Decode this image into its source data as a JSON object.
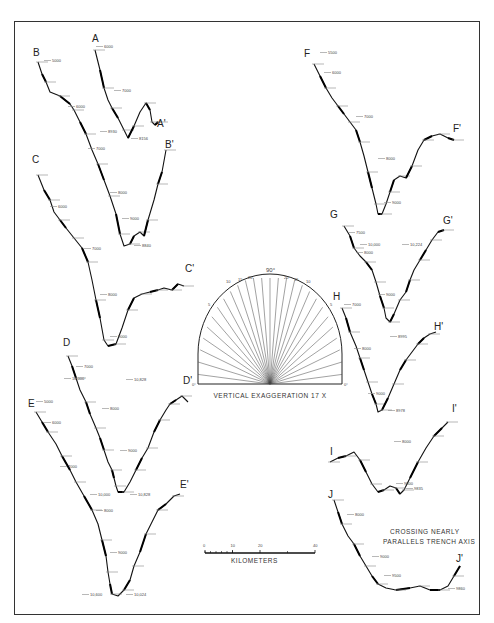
{
  "figure": {
    "frame": {
      "x": 14,
      "y": 21,
      "w": 466,
      "h": 594
    }
  },
  "profiles": [
    {
      "id": "A",
      "start_label": "A",
      "end_label": "A'",
      "start_pos": [
        92,
        42
      ],
      "end_pos": [
        157,
        127
      ],
      "points": [
        [
          95,
          50
        ],
        [
          100,
          70
        ],
        [
          104,
          88
        ],
        [
          108,
          100
        ],
        [
          112,
          108
        ],
        [
          118,
          118
        ],
        [
          124,
          130
        ],
        [
          128,
          138
        ],
        [
          134,
          126
        ],
        [
          140,
          112
        ],
        [
          146,
          103
        ],
        [
          150,
          110
        ],
        [
          152,
          122
        ],
        [
          155,
          125
        ],
        [
          158,
          122
        ]
      ],
      "depth_labels": [
        {
          "text": "6000",
          "x": 104,
          "y": 48
        },
        {
          "text": "7000",
          "x": 122,
          "y": 92
        },
        {
          "text": "8930",
          "x": 108,
          "y": 133
        },
        {
          "text": "8156",
          "x": 139,
          "y": 140
        }
      ]
    },
    {
      "id": "B",
      "start_label": "B",
      "end_label": "B'",
      "start_pos": [
        33,
        56
      ],
      "end_pos": [
        165,
        148
      ],
      "points": [
        [
          38,
          62
        ],
        [
          42,
          74
        ],
        [
          46,
          82
        ],
        [
          50,
          92
        ],
        [
          60,
          96
        ],
        [
          70,
          104
        ],
        [
          74,
          110
        ],
        [
          80,
          122
        ],
        [
          86,
          134
        ],
        [
          92,
          150
        ],
        [
          98,
          164
        ],
        [
          104,
          180
        ],
        [
          110,
          196
        ],
        [
          116,
          214
        ],
        [
          120,
          234
        ],
        [
          124,
          246
        ],
        [
          130,
          244
        ],
        [
          134,
          236
        ],
        [
          140,
          232
        ],
        [
          144,
          236
        ],
        [
          148,
          220
        ],
        [
          154,
          200
        ],
        [
          158,
          184
        ],
        [
          162,
          172
        ],
        [
          166,
          150
        ]
      ],
      "depth_labels": [
        {
          "text": "5000",
          "x": 52,
          "y": 62
        },
        {
          "text": "6000",
          "x": 76,
          "y": 108
        },
        {
          "text": "7000",
          "x": 96,
          "y": 150
        },
        {
          "text": "8000",
          "x": 118,
          "y": 194
        },
        {
          "text": "9000",
          "x": 130,
          "y": 220
        },
        {
          "text": "8840",
          "x": 142,
          "y": 247
        }
      ]
    },
    {
      "id": "C",
      "start_label": "C",
      "end_label": "C'",
      "start_pos": [
        32,
        163
      ],
      "end_pos": [
        185,
        272
      ],
      "points": [
        [
          38,
          175
        ],
        [
          44,
          190
        ],
        [
          50,
          200
        ],
        [
          54,
          212
        ],
        [
          60,
          220
        ],
        [
          66,
          228
        ],
        [
          74,
          238
        ],
        [
          82,
          248
        ],
        [
          88,
          262
        ],
        [
          92,
          280
        ],
        [
          96,
          300
        ],
        [
          100,
          318
        ],
        [
          104,
          340
        ],
        [
          108,
          346
        ],
        [
          116,
          344
        ],
        [
          122,
          328
        ],
        [
          128,
          310
        ],
        [
          134,
          298
        ],
        [
          142,
          294
        ],
        [
          150,
          292
        ],
        [
          158,
          290
        ],
        [
          164,
          288
        ],
        [
          172,
          290
        ],
        [
          178,
          284
        ],
        [
          184,
          286
        ]
      ],
      "depth_labels": [
        {
          "text": "6000",
          "x": 58,
          "y": 208
        },
        {
          "text": "7000",
          "x": 92,
          "y": 250
        },
        {
          "text": "8000",
          "x": 108,
          "y": 296
        },
        {
          "text": "9000",
          "x": 118,
          "y": 338
        }
      ]
    },
    {
      "id": "D",
      "start_label": "D",
      "end_label": "D'",
      "start_pos": [
        63,
        346
      ],
      "end_pos": [
        183,
        384
      ],
      "points": [
        [
          68,
          356
        ],
        [
          72,
          366
        ],
        [
          76,
          378
        ],
        [
          80,
          390
        ],
        [
          86,
          402
        ],
        [
          90,
          414
        ],
        [
          96,
          428
        ],
        [
          100,
          438
        ],
        [
          104,
          450
        ],
        [
          108,
          462
        ],
        [
          112,
          470
        ],
        [
          114,
          478
        ],
        [
          116,
          486
        ],
        [
          118,
          492
        ],
        [
          124,
          492
        ],
        [
          130,
          482
        ],
        [
          136,
          470
        ],
        [
          142,
          458
        ],
        [
          148,
          448
        ],
        [
          154,
          432
        ],
        [
          160,
          420
        ],
        [
          166,
          410
        ],
        [
          170,
          404
        ],
        [
          176,
          400
        ],
        [
          182,
          396
        ],
        [
          188,
          402
        ]
      ],
      "depth_labels": [
        {
          "text": "7000",
          "x": 84,
          "y": 368
        },
        {
          "text": "8000",
          "x": 110,
          "y": 410
        },
        {
          "text": "9000",
          "x": 128,
          "y": 452
        },
        {
          "text": "10,000",
          "x": 72,
          "y": 380
        },
        {
          "text": "10,828",
          "x": 134,
          "y": 381
        }
      ]
    },
    {
      "id": "E",
      "start_label": "E",
      "end_label": "E'",
      "start_pos": [
        28,
        407
      ],
      "end_pos": [
        180,
        488
      ],
      "points": [
        [
          36,
          412
        ],
        [
          42,
          422
        ],
        [
          48,
          432
        ],
        [
          56,
          444
        ],
        [
          62,
          456
        ],
        [
          70,
          470
        ],
        [
          76,
          482
        ],
        [
          84,
          496
        ],
        [
          92,
          510
        ],
        [
          98,
          524
        ],
        [
          102,
          540
        ],
        [
          106,
          556
        ],
        [
          108,
          572
        ],
        [
          110,
          584
        ],
        [
          112,
          594
        ],
        [
          118,
          596
        ],
        [
          124,
          590
        ],
        [
          130,
          580
        ],
        [
          134,
          566
        ],
        [
          140,
          552
        ],
        [
          146,
          534
        ],
        [
          152,
          522
        ],
        [
          158,
          510
        ],
        [
          166,
          504
        ],
        [
          174,
          496
        ],
        [
          180,
          494
        ]
      ],
      "depth_labels": [
        {
          "text": "5000",
          "x": 44,
          "y": 403
        },
        {
          "text": "6000",
          "x": 52,
          "y": 424
        },
        {
          "text": "7000",
          "x": 68,
          "y": 468
        },
        {
          "text": "8000",
          "x": 104,
          "y": 512
        },
        {
          "text": "9000",
          "x": 118,
          "y": 554
        },
        {
          "text": "10,000",
          "x": 98,
          "y": 496
        },
        {
          "text": "10,828",
          "x": 138,
          "y": 496
        },
        {
          "text": "10,600",
          "x": 90,
          "y": 596
        },
        {
          "text": "10,024",
          "x": 134,
          "y": 596
        }
      ]
    },
    {
      "id": "F",
      "start_label": "F",
      "end_label": "F'",
      "start_pos": [
        304,
        57
      ],
      "end_pos": [
        453,
        132
      ],
      "points": [
        [
          314,
          64
        ],
        [
          320,
          76
        ],
        [
          326,
          88
        ],
        [
          332,
          98
        ],
        [
          338,
          106
        ],
        [
          344,
          114
        ],
        [
          350,
          122
        ],
        [
          356,
          130
        ],
        [
          360,
          142
        ],
        [
          364,
          156
        ],
        [
          368,
          172
        ],
        [
          372,
          188
        ],
        [
          376,
          204
        ],
        [
          378,
          214
        ],
        [
          382,
          214
        ],
        [
          386,
          204
        ],
        [
          390,
          192
        ],
        [
          394,
          180
        ],
        [
          400,
          176
        ],
        [
          406,
          178
        ],
        [
          412,
          166
        ],
        [
          418,
          150
        ],
        [
          424,
          140
        ],
        [
          432,
          136
        ],
        [
          440,
          134
        ],
        [
          448,
          138
        ],
        [
          454,
          140
        ]
      ],
      "depth_labels": [
        {
          "text": "5500",
          "x": 328,
          "y": 54
        },
        {
          "text": "6000",
          "x": 332,
          "y": 74
        },
        {
          "text": "7000",
          "x": 364,
          "y": 118
        },
        {
          "text": "8000",
          "x": 386,
          "y": 160
        },
        {
          "text": "9000",
          "x": 392,
          "y": 204
        },
        {
          "text": "10,000",
          "x": 368,
          "y": 246
        },
        {
          "text": "10,224",
          "x": 410,
          "y": 246
        }
      ]
    },
    {
      "id": "G",
      "start_label": "G",
      "end_label": "G'",
      "start_pos": [
        330,
        218
      ],
      "end_pos": [
        443,
        224
      ],
      "points": [
        [
          344,
          226
        ],
        [
          350,
          236
        ],
        [
          354,
          248
        ],
        [
          360,
          256
        ],
        [
          366,
          262
        ],
        [
          372,
          270
        ],
        [
          376,
          282
        ],
        [
          380,
          296
        ],
        [
          384,
          308
        ],
        [
          386,
          318
        ],
        [
          390,
          322
        ],
        [
          394,
          314
        ],
        [
          400,
          300
        ],
        [
          406,
          292
        ],
        [
          410,
          280
        ],
        [
          414,
          270
        ],
        [
          420,
          260
        ],
        [
          426,
          250
        ],
        [
          432,
          240
        ],
        [
          438,
          232
        ],
        [
          444,
          230
        ]
      ],
      "depth_labels": [
        {
          "text": "7500",
          "x": 356,
          "y": 234
        },
        {
          "text": "8000",
          "x": 364,
          "y": 254
        },
        {
          "text": "9000",
          "x": 386,
          "y": 296
        }
      ]
    },
    {
      "id": "H",
      "start_label": "H",
      "end_label": "H'",
      "start_pos": [
        333,
        300
      ],
      "end_pos": [
        434,
        330
      ],
      "points": [
        [
          342,
          308
        ],
        [
          346,
          318
        ],
        [
          350,
          332
        ],
        [
          356,
          346
        ],
        [
          360,
          358
        ],
        [
          364,
          370
        ],
        [
          368,
          382
        ],
        [
          372,
          394
        ],
        [
          376,
          404
        ],
        [
          378,
          412
        ],
        [
          382,
          410
        ],
        [
          388,
          398
        ],
        [
          394,
          384
        ],
        [
          400,
          370
        ],
        [
          406,
          360
        ],
        [
          412,
          352
        ],
        [
          418,
          344
        ],
        [
          424,
          338
        ],
        [
          430,
          334
        ],
        [
          436,
          332
        ]
      ],
      "depth_labels": [
        {
          "text": "7000",
          "x": 352,
          "y": 306
        },
        {
          "text": "8000",
          "x": 362,
          "y": 350
        },
        {
          "text": "9000",
          "x": 376,
          "y": 395
        },
        {
          "text": "8995",
          "x": 398,
          "y": 338
        },
        {
          "text": "8978",
          "x": 396,
          "y": 412
        }
      ]
    },
    {
      "id": "I",
      "start_label": "I",
      "end_label": "I'",
      "start_pos": [
        330,
        455
      ],
      "end_pos": [
        452,
        412
      ],
      "points": [
        [
          330,
          462
        ],
        [
          338,
          458
        ],
        [
          346,
          456
        ],
        [
          354,
          452
        ],
        [
          360,
          460
        ],
        [
          366,
          472
        ],
        [
          372,
          484
        ],
        [
          378,
          492
        ],
        [
          384,
          490
        ],
        [
          390,
          486
        ],
        [
          396,
          488
        ],
        [
          400,
          494
        ],
        [
          404,
          490
        ],
        [
          410,
          478
        ],
        [
          418,
          462
        ],
        [
          426,
          448
        ],
        [
          434,
          436
        ],
        [
          442,
          428
        ],
        [
          448,
          422
        ]
      ],
      "depth_labels": [
        {
          "text": "8000",
          "x": 402,
          "y": 443
        },
        {
          "text": "9800",
          "x": 404,
          "y": 485
        },
        {
          "text": "9835",
          "x": 414,
          "y": 490
        }
      ]
    },
    {
      "id": "J",
      "start_label": "J",
      "end_label": "J'",
      "start_pos": [
        328,
        498
      ],
      "end_pos": [
        456,
        562
      ],
      "points": [
        [
          334,
          500
        ],
        [
          338,
          512
        ],
        [
          342,
          524
        ],
        [
          348,
          536
        ],
        [
          354,
          544
        ],
        [
          360,
          556
        ],
        [
          366,
          566
        ],
        [
          372,
          576
        ],
        [
          378,
          584
        ],
        [
          386,
          588
        ],
        [
          396,
          590
        ],
        [
          410,
          588
        ],
        [
          420,
          586
        ],
        [
          430,
          590
        ],
        [
          440,
          590
        ],
        [
          448,
          586
        ],
        [
          454,
          576
        ],
        [
          460,
          566
        ]
      ],
      "depth_labels": [
        {
          "text": "8000",
          "x": 355,
          "y": 516
        },
        {
          "text": "9000",
          "x": 380,
          "y": 558
        },
        {
          "text": "9500",
          "x": 392,
          "y": 577
        },
        {
          "text": "9860",
          "x": 456,
          "y": 590
        }
      ]
    }
  ],
  "exaggeration_diagram": {
    "center": [
      270,
      384
    ],
    "radius_x": 72,
    "radius_y": 110,
    "angle_labels": [
      "10",
      "15",
      "20",
      "90°",
      "20",
      "15",
      "10"
    ],
    "left_zero": "0°",
    "right_zero": "0°",
    "left_5": "5",
    "right_5": "5",
    "caption": "VERTICAL EXAGGERATION 17 X"
  },
  "scale_bar": {
    "ticks": [
      "0",
      "10",
      "20",
      "40"
    ],
    "label": "KILOMETERS",
    "x0": 205,
    "x1": 315,
    "y": 553
  },
  "note": {
    "line1": "CROSSING NEARLY",
    "line2": "PARALLELS TRENCH AXIS"
  }
}
